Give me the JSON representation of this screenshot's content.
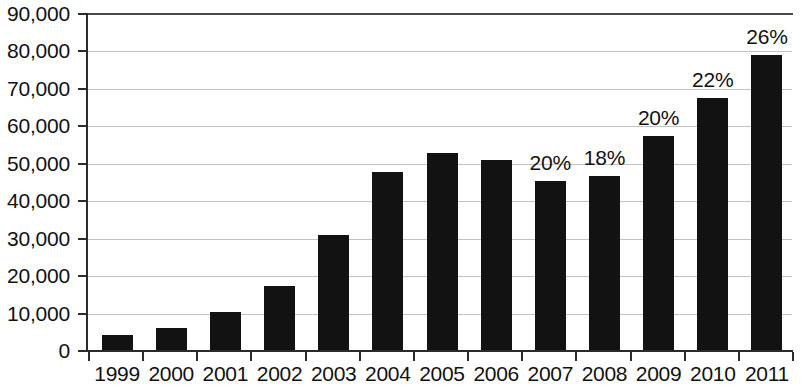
{
  "chart_data": {
    "type": "bar",
    "title": "",
    "xlabel": "",
    "ylabel": "",
    "categories": [
      "1999",
      "2000",
      "2001",
      "2002",
      "2003",
      "2004",
      "2005",
      "2006",
      "2007",
      "2008",
      "2009",
      "2010",
      "2011"
    ],
    "values": [
      4200,
      6100,
      10500,
      17300,
      31000,
      47800,
      52800,
      51000,
      45500,
      46800,
      57300,
      67500,
      79000
    ],
    "point_labels": [
      "",
      "",
      "",
      "",
      "",
      "",
      "",
      "",
      "20%",
      "18%",
      "20%",
      "22%",
      "26%"
    ],
    "ylim": [
      0,
      90000
    ],
    "ytick_labels": [
      "0",
      "10,000",
      "20,000",
      "30,000",
      "40,000",
      "50,000",
      "60,000",
      "70,000",
      "80,000",
      "90,000"
    ],
    "ytick_values": [
      0,
      10000,
      20000,
      30000,
      40000,
      50000,
      60000,
      70000,
      80000,
      90000
    ],
    "grid": true,
    "legend": false,
    "bar_color": "#121212",
    "gridline_color": "#c2c2c2",
    "axis_color": "#2b2b2b"
  }
}
